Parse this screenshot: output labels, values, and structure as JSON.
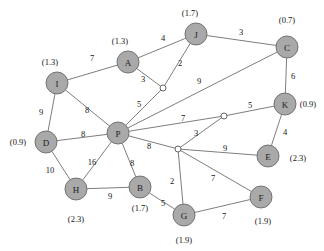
{
  "diagram": {
    "type": "weighted-undirected-graph",
    "title": "",
    "node_radius": 11,
    "junction_radius": 3,
    "colors": {
      "node_fill": "#a9a9a9",
      "node_stroke": "#6a6a6a",
      "junction_fill": "#ffffff",
      "edge_stroke": "#6e6e6e",
      "text": "#141414",
      "background": "#ffffff"
    }
  },
  "nodes": [
    {
      "id": "A",
      "label": "A",
      "x": 128,
      "y": 62,
      "annotation": "(1.3)",
      "ax": 120,
      "ay": 41
    },
    {
      "id": "J",
      "label": "J",
      "x": 196,
      "y": 34,
      "annotation": "(1.7)",
      "ax": 190,
      "ay": 13
    },
    {
      "id": "C",
      "label": "C",
      "x": 287,
      "y": 47,
      "annotation": "(0.7)",
      "ax": 287,
      "ay": 20
    },
    {
      "id": "I",
      "label": "I",
      "x": 57,
      "y": 83,
      "annotation": "(1.3)",
      "ax": 50,
      "ay": 62
    },
    {
      "id": "K",
      "label": "K",
      "x": 285,
      "y": 104,
      "annotation": "(0.9)",
      "ax": 308,
      "ay": 104
    },
    {
      "id": "P",
      "label": "P",
      "x": 118,
      "y": 133,
      "annotation": "",
      "ax": 0,
      "ay": 0
    },
    {
      "id": "D",
      "label": "D",
      "x": 46,
      "y": 142,
      "annotation": "(0.9)",
      "ax": 18,
      "ay": 142
    },
    {
      "id": "E",
      "label": "E",
      "x": 268,
      "y": 156,
      "annotation": "(2.3)",
      "ax": 298,
      "ay": 158
    },
    {
      "id": "H",
      "label": "H",
      "x": 76,
      "y": 189,
      "annotation": "(2.3)",
      "ax": 76,
      "ay": 219
    },
    {
      "id": "B",
      "label": "B",
      "x": 140,
      "y": 187,
      "annotation": "(1.7)",
      "ax": 140,
      "ay": 208
    },
    {
      "id": "F",
      "label": "F",
      "x": 261,
      "y": 197,
      "annotation": "(1.9)",
      "ax": 263,
      "ay": 221
    },
    {
      "id": "G",
      "label": "G",
      "x": 184,
      "y": 215,
      "annotation": "(1.9)",
      "ax": 184,
      "ay": 240
    }
  ],
  "junctions": [
    {
      "id": "j1",
      "x": 163,
      "y": 88
    },
    {
      "id": "j2",
      "x": 224,
      "y": 116
    },
    {
      "id": "j3",
      "x": 178,
      "y": 149
    }
  ],
  "edges": [
    {
      "from": "I",
      "to": "A",
      "weight": "7",
      "lx": 92,
      "ly": 58
    },
    {
      "from": "A",
      "to": "J",
      "weight": "4",
      "lx": 163,
      "ly": 38
    },
    {
      "from": "J",
      "to": "C",
      "weight": "3",
      "lx": 241,
      "ly": 32
    },
    {
      "from": "J",
      "to": "j1",
      "weight": "2",
      "lx": 180,
      "ly": 63
    },
    {
      "from": "A",
      "to": "j1",
      "weight": "3",
      "lx": 143,
      "ly": 79
    },
    {
      "from": "C",
      "to": "K",
      "weight": "6",
      "lx": 293,
      "ly": 76
    },
    {
      "from": "I",
      "to": "D",
      "weight": "9",
      "lx": 41,
      "ly": 112
    },
    {
      "from": "I",
      "to": "P",
      "weight": "8",
      "lx": 87,
      "ly": 110
    },
    {
      "from": "D",
      "to": "P",
      "weight": "8",
      "lx": 83,
      "ly": 134
    },
    {
      "from": "P",
      "to": "j1",
      "weight": "5",
      "lx": 139,
      "ly": 104
    },
    {
      "from": "P",
      "to": "C",
      "weight": "9",
      "lx": 199,
      "ly": 81
    },
    {
      "from": "P",
      "to": "j2",
      "weight": "7",
      "lx": 183,
      "ly": 118
    },
    {
      "from": "j2",
      "to": "K",
      "weight": "5",
      "lx": 250,
      "ly": 105
    },
    {
      "from": "P",
      "to": "j3",
      "weight": "8",
      "lx": 149,
      "ly": 146
    },
    {
      "from": "j3",
      "to": "j2",
      "weight": "3",
      "lx": 196,
      "ly": 133
    },
    {
      "from": "K",
      "to": "E",
      "weight": "4",
      "lx": 285,
      "ly": 132
    },
    {
      "from": "j3",
      "to": "E",
      "weight": "9",
      "lx": 225,
      "ly": 148
    },
    {
      "from": "D",
      "to": "H",
      "weight": "10",
      "lx": 50,
      "ly": 170
    },
    {
      "from": "P",
      "to": "H",
      "weight": "16",
      "lx": 92,
      "ly": 162
    },
    {
      "from": "P",
      "to": "B",
      "weight": "8",
      "lx": 132,
      "ly": 163
    },
    {
      "from": "H",
      "to": "B",
      "weight": "9",
      "lx": 110,
      "ly": 196
    },
    {
      "from": "B",
      "to": "G",
      "weight": "5",
      "lx": 163,
      "ly": 203
    },
    {
      "from": "j3",
      "to": "G",
      "weight": "2",
      "lx": 172,
      "ly": 181
    },
    {
      "from": "j3",
      "to": "F",
      "weight": "7",
      "lx": 213,
      "ly": 178
    },
    {
      "from": "G",
      "to": "F",
      "weight": "7",
      "lx": 224,
      "ly": 216
    }
  ]
}
